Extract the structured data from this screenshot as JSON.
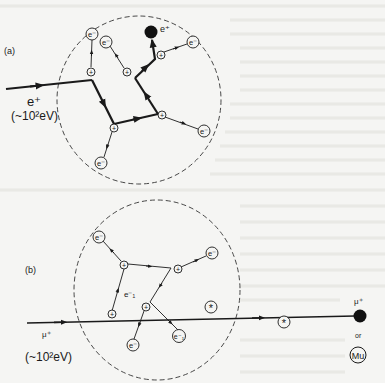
{
  "panels": {
    "a": {
      "label": "(a)",
      "incoming_particle": "e⁺",
      "incoming_energy": "(~10²eV)",
      "final_particle": "e⁺",
      "electron_label": "e⁻",
      "ion_label": "+"
    },
    "b": {
      "label": "(b)",
      "incoming_particle": "μ⁺",
      "incoming_energy": "(~10²eV)",
      "secondary_electron_label": "e⁻₁",
      "electron_label": "e⁻",
      "ion_label": "+",
      "excited_label": "*",
      "final_particle": "μ⁺",
      "or_text": "or",
      "muonium_label": "Mu"
    }
  },
  "colors": {
    "ink": "#1a1a1a",
    "paper": "#f5f5f3",
    "dashed": "#333333"
  }
}
